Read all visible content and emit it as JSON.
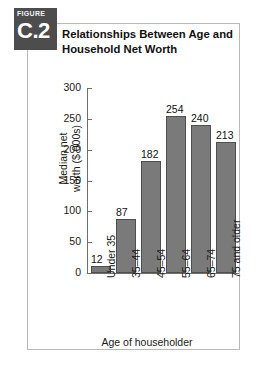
{
  "figure": {
    "kicker": "FIGURE",
    "number": "C.2",
    "title_line1": "Relationships Between Age and",
    "title_line2": "Household Net Worth"
  },
  "colors": {
    "badge_bg": "#4d4d4d",
    "bar_fill": "#7a7a7a",
    "bar_stroke": "#4f4f4f",
    "axis": "#6e6e6e",
    "frame": "#b9b9b9",
    "text": "#1a1a1a"
  },
  "chart_data": {
    "type": "bar",
    "title": "Relationships Between Age and Household Net Worth",
    "categories": [
      "Under 35",
      "35–44",
      "45–54",
      "55–64",
      "65–74",
      "75 and older"
    ],
    "values": [
      12,
      87,
      182,
      254,
      240,
      213
    ],
    "data_labels": [
      "12",
      "87",
      "182",
      "254",
      "240",
      "213"
    ],
    "xlabel": "Age of householder",
    "ylabel_line1": "Median net",
    "ylabel_line2": "worth ($ 000s)",
    "ylabel": "Median net worth ($ 000s)",
    "ylim": [
      0,
      300
    ],
    "ytick_step": 50,
    "ytick_labels": [
      "0",
      "50",
      "100",
      "150",
      "200",
      "250",
      "300"
    ],
    "grid": false,
    "legend": false
  }
}
